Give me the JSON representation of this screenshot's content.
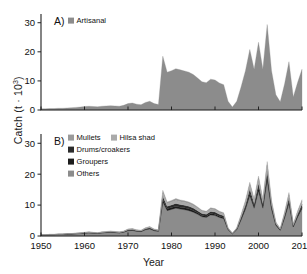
{
  "figure": {
    "y_axis_title_html": "Catch (t &#183; 10<sup>3</sup>)",
    "y_axis_title_text": "Catch (t · 10^3)",
    "x_axis_title": "Year"
  },
  "panelA": {
    "label": "A)",
    "legend": [
      {
        "name": "Artisanal",
        "color": "#8c8c8c"
      }
    ]
  },
  "panelB": {
    "label": "B)",
    "legend": [
      {
        "name": "Mullets",
        "color": "#9a9a9a"
      },
      {
        "name": "Hilsa shad",
        "color": "#aaaaaa"
      },
      {
        "name": "Drums/croakers",
        "color": "#2b2b2b"
      },
      {
        "name": "Groupers",
        "color": "#1c1c1c"
      },
      {
        "name": "Others",
        "color": "#8c8c8c"
      }
    ]
  },
  "chart_data": [
    {
      "type": "area",
      "panel": "A",
      "title": "A)",
      "xlabel": "Year",
      "ylabel": "Catch (t · 10^3)",
      "xlim": [
        1950,
        2010
      ],
      "ylim": [
        0,
        33
      ],
      "yticks": [
        0,
        10,
        20,
        30
      ],
      "xticks": [
        1950,
        1960,
        1970,
        1980,
        1990,
        2000,
        2010
      ],
      "grid": false,
      "legend_position": "top-left",
      "series": [
        {
          "name": "Artisanal",
          "color": "#8c8c8c",
          "x": [
            1950,
            1951,
            1952,
            1953,
            1954,
            1955,
            1956,
            1957,
            1958,
            1959,
            1960,
            1961,
            1962,
            1963,
            1964,
            1965,
            1966,
            1967,
            1968,
            1969,
            1970,
            1971,
            1972,
            1973,
            1974,
            1975,
            1976,
            1977,
            1978,
            1979,
            1980,
            1981,
            1982,
            1983,
            1984,
            1985,
            1986,
            1987,
            1988,
            1989,
            1990,
            1991,
            1992,
            1993,
            1994,
            1995,
            1996,
            1997,
            1998,
            1999,
            2000,
            2001,
            2002,
            2003,
            2004,
            2005,
            2006,
            2007,
            2008,
            2009,
            2010
          ],
          "values": [
            0.4,
            0.4,
            0.5,
            0.5,
            0.6,
            0.6,
            0.7,
            0.8,
            0.9,
            1.0,
            1.2,
            1.3,
            1.2,
            1.1,
            1.3,
            1.4,
            1.5,
            1.4,
            1.3,
            1.6,
            2.2,
            2.4,
            2.0,
            1.8,
            2.6,
            3.0,
            2.2,
            1.9,
            18.5,
            13.0,
            13.5,
            14.2,
            13.8,
            13.4,
            13.0,
            12.2,
            11.0,
            9.7,
            9.4,
            10.6,
            10.3,
            9.3,
            8.7,
            3.0,
            1.0,
            3.0,
            8.0,
            13.5,
            20.8,
            14.0,
            23.3,
            14.0,
            29.4,
            13.5,
            5.2,
            2.8,
            9.0,
            16.6,
            4.5,
            9.5,
            14.0
          ]
        }
      ]
    },
    {
      "type": "area",
      "panel": "B",
      "title": "B)",
      "xlabel": "Year",
      "ylabel": "Catch (t · 10^3)",
      "xlim": [
        1950,
        2010
      ],
      "ylim": [
        0,
        33
      ],
      "yticks": [
        0,
        10,
        20,
        30
      ],
      "xticks": [
        1950,
        1960,
        1970,
        1980,
        1990,
        2000,
        2010
      ],
      "grid": false,
      "stacked": true,
      "legend_position": "top-left",
      "x": [
        1950,
        1951,
        1952,
        1953,
        1954,
        1955,
        1956,
        1957,
        1958,
        1959,
        1960,
        1961,
        1962,
        1963,
        1964,
        1965,
        1966,
        1967,
        1968,
        1969,
        1970,
        1971,
        1972,
        1973,
        1974,
        1975,
        1976,
        1977,
        1978,
        1979,
        1980,
        1981,
        1982,
        1983,
        1984,
        1985,
        1986,
        1987,
        1988,
        1989,
        1990,
        1991,
        1992,
        1993,
        1994,
        1995,
        1996,
        1997,
        1998,
        1999,
        2000,
        2001,
        2002,
        2003,
        2004,
        2005,
        2006,
        2007,
        2008,
        2009,
        2010
      ],
      "series": [
        {
          "name": "Others",
          "color": "#8c8c8c",
          "values": [
            0.3,
            0.3,
            0.4,
            0.4,
            0.5,
            0.5,
            0.6,
            0.6,
            0.7,
            0.8,
            0.9,
            1.0,
            0.9,
            0.8,
            1.0,
            1.1,
            1.2,
            1.1,
            1.0,
            1.2,
            1.7,
            1.8,
            1.5,
            1.4,
            2.0,
            2.3,
            1.7,
            1.5,
            11.0,
            8.2,
            8.6,
            9.0,
            8.7,
            8.5,
            8.2,
            7.7,
            7.0,
            6.2,
            6.0,
            6.8,
            6.6,
            6.0,
            5.6,
            2.0,
            0.7,
            2.0,
            5.2,
            8.6,
            13.0,
            9.0,
            14.5,
            9.0,
            18.0,
            8.6,
            3.4,
            1.8,
            5.8,
            10.5,
            2.9,
            6.1,
            8.8
          ]
        },
        {
          "name": "Groupers",
          "color": "#1c1c1c",
          "values": [
            0.02,
            0.02,
            0.03,
            0.03,
            0.03,
            0.04,
            0.04,
            0.04,
            0.05,
            0.05,
            0.06,
            0.07,
            0.06,
            0.06,
            0.07,
            0.07,
            0.08,
            0.08,
            0.07,
            0.08,
            0.12,
            0.13,
            0.11,
            0.1,
            0.14,
            0.16,
            0.12,
            0.1,
            0.8,
            0.6,
            0.6,
            0.65,
            0.62,
            0.6,
            0.58,
            0.55,
            0.5,
            0.45,
            0.42,
            0.48,
            0.47,
            0.42,
            0.4,
            0.14,
            0.05,
            0.14,
            0.37,
            0.6,
            0.9,
            0.62,
            1.0,
            0.62,
            1.25,
            0.6,
            0.24,
            0.13,
            0.4,
            0.73,
            0.2,
            0.42,
            0.6
          ]
        },
        {
          "name": "Drums/croakers",
          "color": "#2b2b2b",
          "values": [
            0.03,
            0.03,
            0.04,
            0.04,
            0.05,
            0.05,
            0.06,
            0.06,
            0.07,
            0.08,
            0.09,
            0.1,
            0.09,
            0.08,
            0.1,
            0.11,
            0.12,
            0.11,
            0.1,
            0.12,
            0.17,
            0.18,
            0.15,
            0.14,
            0.2,
            0.23,
            0.17,
            0.15,
            1.1,
            0.82,
            0.86,
            0.9,
            0.87,
            0.85,
            0.82,
            0.77,
            0.7,
            0.62,
            0.6,
            0.68,
            0.66,
            0.6,
            0.56,
            0.2,
            0.07,
            0.2,
            0.52,
            0.86,
            1.3,
            0.9,
            1.45,
            0.9,
            1.8,
            0.86,
            0.34,
            0.18,
            0.58,
            1.05,
            0.29,
            0.61,
            0.88
          ]
        },
        {
          "name": "Hilsa shad",
          "color": "#aaaaaa",
          "values": [
            0.03,
            0.03,
            0.04,
            0.04,
            0.05,
            0.05,
            0.06,
            0.06,
            0.07,
            0.08,
            0.09,
            0.1,
            0.09,
            0.08,
            0.1,
            0.11,
            0.12,
            0.11,
            0.1,
            0.12,
            0.17,
            0.18,
            0.15,
            0.14,
            0.2,
            0.23,
            0.17,
            0.15,
            1.1,
            0.82,
            0.86,
            0.9,
            0.87,
            0.85,
            0.82,
            0.77,
            0.7,
            0.62,
            0.6,
            0.68,
            0.66,
            0.6,
            0.56,
            0.2,
            0.07,
            0.2,
            0.52,
            0.86,
            1.3,
            0.9,
            1.45,
            0.9,
            1.8,
            0.86,
            0.34,
            0.18,
            0.58,
            1.05,
            0.29,
            0.61,
            0.88
          ]
        },
        {
          "name": "Mullets",
          "color": "#9a9a9a",
          "values": [
            0.02,
            0.02,
            0.03,
            0.03,
            0.03,
            0.04,
            0.04,
            0.04,
            0.05,
            0.05,
            0.06,
            0.07,
            0.06,
            0.06,
            0.07,
            0.07,
            0.08,
            0.08,
            0.07,
            0.08,
            0.12,
            0.13,
            0.11,
            0.1,
            0.14,
            0.16,
            0.12,
            0.1,
            0.8,
            0.6,
            0.6,
            0.65,
            0.62,
            0.6,
            0.58,
            0.55,
            0.5,
            0.45,
            0.42,
            0.48,
            0.47,
            0.42,
            0.4,
            0.14,
            0.05,
            0.14,
            0.37,
            0.6,
            0.9,
            0.62,
            1.0,
            0.62,
            1.25,
            0.6,
            0.24,
            0.13,
            0.4,
            0.73,
            0.2,
            0.42,
            0.6
          ]
        }
      ]
    }
  ]
}
